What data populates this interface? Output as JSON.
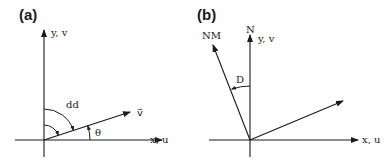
{
  "panels": [
    {
      "id": "a",
      "label": "(a)",
      "y_axis_label": "y, v",
      "x_axis_label": "x, u",
      "vector_label": "v⃗",
      "angle_labels": {
        "direction": "dd",
        "theta": "θ"
      }
    },
    {
      "id": "b",
      "label": "(b)",
      "north_label": "N",
      "y_axis_label": "y, v",
      "x_axis_label": "x, u",
      "magnetic_north_label": "NM",
      "declination_label": "D"
    }
  ],
  "colors": {
    "ink": "#1a1a1a",
    "background": "#ffffff"
  }
}
